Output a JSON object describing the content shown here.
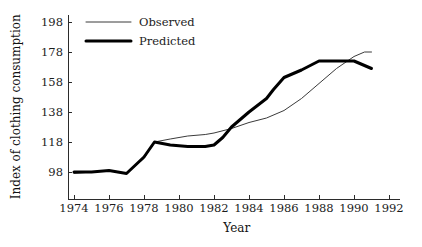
{
  "chart_data": {
    "type": "line",
    "title": "",
    "xlabel": "Year",
    "ylabel": "Index of clothing consumption",
    "xlim": [
      1973,
      1992.6
    ],
    "ylim": [
      88,
      203
    ],
    "grid": false,
    "legend_position": "top-left",
    "xticks": [
      1974,
      1976,
      1978,
      1980,
      1982,
      1984,
      1986,
      1988,
      1990,
      1992
    ],
    "xtick_labels": [
      "1974",
      "1976",
      "1978",
      "1980",
      "1982",
      "1984",
      "1986",
      "1988",
      "1990",
      "1992"
    ],
    "yticks": [
      98,
      118,
      138,
      158,
      178,
      198
    ],
    "ytick_labels": [
      "98",
      "118",
      "138",
      "158",
      "178",
      "198"
    ],
    "series": [
      {
        "name": "Observed",
        "style": "thin",
        "color": "#3b3b3b",
        "x": [
          1974,
          1975,
          1976,
          1977,
          1978,
          1978.6,
          1979.5,
          1980.5,
          1981.5,
          1982,
          1983,
          1984,
          1985,
          1986,
          1987,
          1988,
          1989,
          1990,
          1990.6,
          1991
        ],
        "values": [
          97,
          98,
          99,
          97,
          107,
          118,
          120,
          122,
          123,
          124,
          127,
          131,
          134,
          139,
          147,
          157,
          167,
          175,
          178,
          178
        ]
      },
      {
        "name": "Predicted",
        "style": "thick",
        "color": "#000000",
        "x": [
          1974,
          1975,
          1976,
          1977,
          1978,
          1978.6,
          1979.5,
          1980.5,
          1981.5,
          1982,
          1982.5,
          1983,
          1984,
          1985,
          1985.4,
          1986,
          1987,
          1988,
          1989,
          1990,
          1991
        ],
        "values": [
          98,
          98,
          99,
          97,
          108,
          118,
          116,
          115,
          115,
          116,
          121,
          128,
          138,
          147,
          153,
          161,
          166,
          172,
          172,
          172,
          167
        ]
      }
    ]
  },
  "legend": {
    "items": [
      {
        "label": "Observed"
      },
      {
        "label": "Predicted"
      }
    ]
  },
  "axes": {
    "x_title": "Year",
    "y_title": "Index of clothing consumption"
  }
}
